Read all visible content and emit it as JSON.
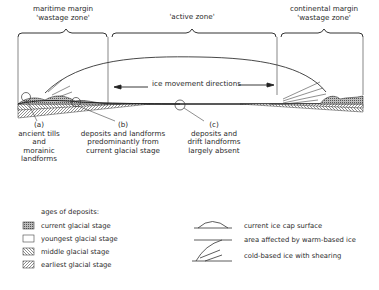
{
  "zones": {
    "maritime": {
      "line1": "maritime margin",
      "line2": "'wastage zone'"
    },
    "active": {
      "line1": "'active zone'"
    },
    "continental": {
      "line1": "continental margin",
      "line2": "'wastage zone'"
    }
  },
  "arrow_label": "ice movement directions",
  "callouts": [
    {
      "letter": "(a)",
      "lines": [
        "ancient tills",
        "and",
        "morainic",
        "landforms"
      ]
    },
    {
      "letter": "(b)",
      "lines": [
        "deposits and landforms",
        "predominantly from",
        "current glacial stage"
      ]
    },
    {
      "letter": "(c)",
      "lines": [
        "deposits and",
        "drift landforms",
        "largely absent"
      ]
    }
  ],
  "legend_ages": {
    "title": "ages of deposits:",
    "items": [
      {
        "label": "current glacial stage",
        "pattern": "stippled-dense"
      },
      {
        "label": "youngest glacial stage",
        "pattern": "blank"
      },
      {
        "label": "middle glacial stage",
        "pattern": "hatch-back"
      },
      {
        "label": "earliest glacial stage",
        "pattern": "hatch-forward"
      }
    ]
  },
  "legend_symbols": [
    {
      "label": "current ice cap surface",
      "symbol": "dome-line"
    },
    {
      "label": "area affected by warm-based ice",
      "symbol": "straight-line"
    },
    {
      "label": "cold-based ice with shearing",
      "symbol": "shear-lines"
    }
  ],
  "colors": {
    "ink": "#2a2a2a",
    "background": "#ffffff"
  }
}
